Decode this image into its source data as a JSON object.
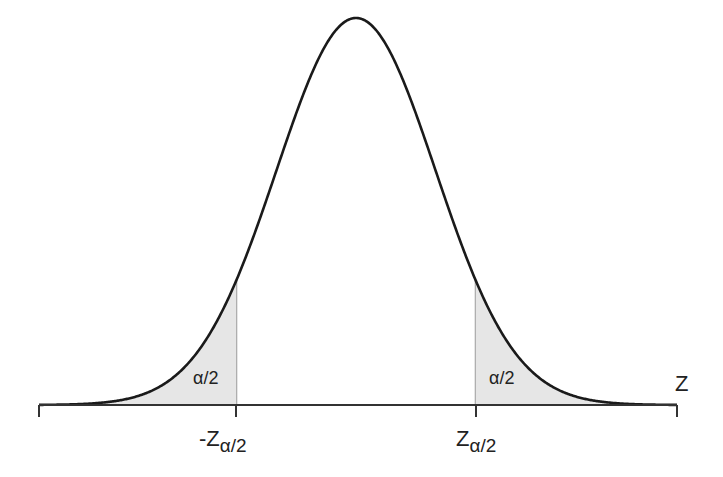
{
  "chart_data": {
    "type": "area",
    "title": "",
    "xlabel": "Z",
    "ylabel": "",
    "distribution": "standard normal",
    "critical_values": {
      "left": "-Zα/2",
      "right": "Zα/2",
      "left_value": -1.5,
      "right_value": 1.5
    },
    "shaded_regions": [
      {
        "name": "left tail",
        "from": -4.0,
        "to": -1.5,
        "label": "α/2"
      },
      {
        "name": "right tail",
        "from": 1.5,
        "to": 4.0,
        "label": "α/2"
      }
    ],
    "x_range": [
      -4.0,
      4.0
    ],
    "grid": false,
    "legend": "none",
    "colors": {
      "curve": "#1a1a1a",
      "shade": "#e6e6e6",
      "axis": "#333333",
      "divider": "#999999"
    }
  },
  "labels": {
    "axis_var": "Z",
    "left_tail": "α/2",
    "right_tail": "α/2",
    "left_crit_main": "-Z",
    "left_crit_sub": "α/2",
    "right_crit_main": "Z",
    "right_crit_sub": "α/2"
  }
}
